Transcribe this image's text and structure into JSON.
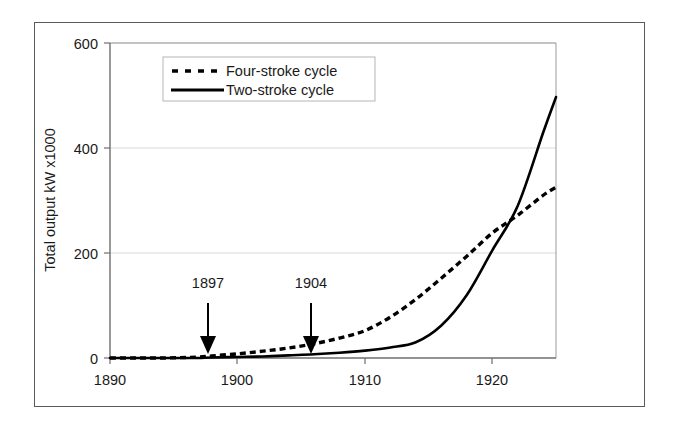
{
  "chart_data": {
    "type": "line",
    "title": "",
    "xlabel": "",
    "ylabel": "Total output kW x1000",
    "xlim": [
      1890,
      1925
    ],
    "ylim": [
      0,
      600
    ],
    "xticks": [
      1890,
      1900,
      1910,
      1920
    ],
    "xtick_labels": [
      "1890",
      "1900",
      "1910",
      "1920"
    ],
    "yticks": [
      0,
      200,
      400,
      600
    ],
    "ytick_labels": [
      "0",
      "200",
      "400",
      "600"
    ],
    "grid": "horizontal",
    "legend_position": "upper-center-left",
    "series": [
      {
        "name": "Four-stroke cycle",
        "style": "dashed",
        "color": "#000000",
        "x": [
          1890,
          1892,
          1894,
          1896,
          1897,
          1898,
          1900,
          1902,
          1904,
          1906,
          1908,
          1910,
          1912,
          1914,
          1916,
          1918,
          1920,
          1922,
          1924,
          1925
        ],
        "values": [
          0,
          0,
          0,
          1,
          2,
          4,
          8,
          13,
          19,
          27,
          38,
          52,
          78,
          112,
          152,
          194,
          238,
          272,
          310,
          325
        ]
      },
      {
        "name": "Two-stroke cycle",
        "style": "solid",
        "color": "#000000",
        "x": [
          1890,
          1892,
          1894,
          1896,
          1897,
          1898,
          1900,
          1902,
          1904,
          1906,
          1908,
          1910,
          1912,
          1914,
          1916,
          1918,
          1920,
          1922,
          1924,
          1925
        ],
        "values": [
          0,
          0,
          0,
          0,
          0,
          1,
          2,
          3,
          5,
          7,
          10,
          14,
          20,
          30,
          62,
          120,
          205,
          290,
          430,
          497
        ]
      }
    ],
    "annotations": [
      {
        "label": "1897",
        "x": 1897,
        "arrow": true,
        "label_y": 185,
        "arrow_from_y": 140,
        "arrow_to_y": 22
      },
      {
        "label": "1904",
        "x": 1904,
        "arrow": true,
        "label_y": 185,
        "arrow_from_y": 140,
        "arrow_to_y": 22
      }
    ]
  },
  "legend": {
    "items": [
      {
        "label": "Four-stroke cycle",
        "style": "dashed"
      },
      {
        "label": "Two-stroke cycle",
        "style": "solid"
      }
    ]
  },
  "colors": {
    "line": "#000000",
    "grid": "#d9d9d9",
    "axis": "#808080",
    "frame": "#5a5a5a",
    "text": "#1a1a1a",
    "background": "#ffffff"
  }
}
